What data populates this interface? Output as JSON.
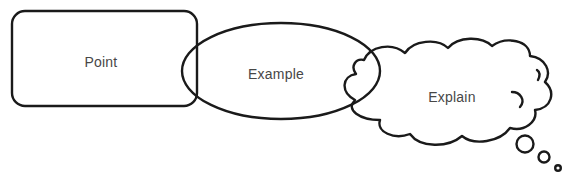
{
  "diagram": {
    "type": "PEE paragraph structure",
    "shapes": [
      {
        "id": "point",
        "kind": "rounded-rectangle",
        "label": "Point"
      },
      {
        "id": "example",
        "kind": "ellipse",
        "label": "Example"
      },
      {
        "id": "explain",
        "kind": "thought-cloud",
        "label": "Explain"
      }
    ],
    "colors": {
      "stroke": "#1a1a1a",
      "text": "#474747",
      "background": "#ffffff"
    }
  }
}
